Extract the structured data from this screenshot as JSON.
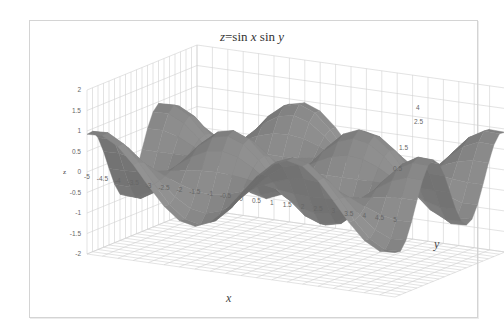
{
  "chart_data": {
    "type": "surface",
    "title": "z=sin x sin y",
    "title_parts": {
      "prefix": "z",
      "eq": "=sin ",
      "x": "x",
      "mid": " sin ",
      "y": "y"
    },
    "xlabel": "x",
    "ylabel": "y",
    "zlabel": "z",
    "function": "z = sin(x) * sin(y)",
    "x": [
      -5,
      -4.5,
      -4,
      -3.5,
      -3,
      -2.5,
      -2,
      -1.5,
      -1,
      -0.5,
      0,
      0.5,
      1,
      1.5,
      2,
      2.5,
      3,
      3.5,
      4,
      4.5,
      5
    ],
    "y": [
      -5,
      -4.5,
      -4,
      -3.5,
      -3,
      -2.5,
      -2,
      -1.5,
      -1,
      -0.5,
      0,
      0.5,
      1,
      1.5,
      2,
      2.5,
      3,
      3.5,
      4,
      4.5,
      5
    ],
    "x_tick_labels": [
      "-5",
      "-4.5",
      "-4",
      "-3.5",
      "-3",
      "-2.5",
      "-2",
      "-1.5",
      "-1",
      "-0.5",
      "0",
      "0.5",
      "1",
      "1.5",
      "2",
      "2.5",
      "3",
      "3.5",
      "4",
      "4.5",
      "5"
    ],
    "y_tick_labels": [
      "4",
      "2.5",
      "1.5",
      "0.5"
    ],
    "z_tick_labels": [
      "2",
      "1.5",
      "1",
      "0.5",
      "0",
      "-0.5",
      "-1",
      "-1.5",
      "-2"
    ],
    "zlim": [
      -2,
      2
    ],
    "grid": true,
    "legend": "none"
  },
  "colors": {
    "surface_light": "#b8b8b8",
    "surface_dark": "#3a3a3a",
    "grid": "#d0d0d0",
    "frame": "#d4d4d4"
  }
}
